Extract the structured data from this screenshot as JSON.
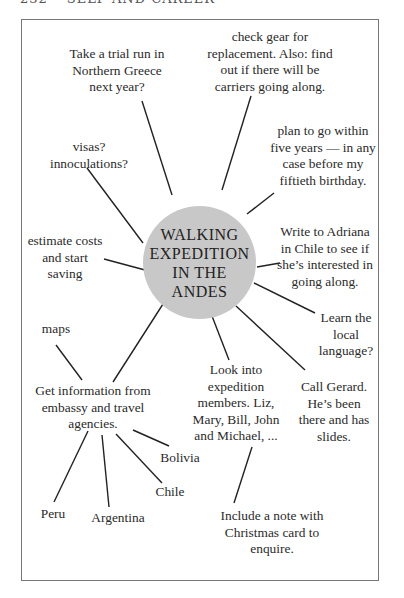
{
  "header": {
    "partial_text": "232 • SELF AND CAREER"
  },
  "colors": {
    "hub_fill": "#c8c8c8",
    "line": "#222222",
    "frame": "#777777"
  },
  "mindmap": {
    "center": "WALKING\nEXPEDITION\nIN THE\nANDES",
    "nodes": {
      "trial_run": "Take a trial run in\nNorthern Greece\nnext year?",
      "gear": "check gear for\nreplacement. Also: find\nout if there will be\ncarriers going along.",
      "plan": "plan to go within\nfive years — in any\ncase before my\nfiftieth birthday.",
      "visas": "visas?\ninnoculations?",
      "adriana": "Write to Adriana\nin Chile to see if\nshe’s interested in\ngoing along.",
      "costs": "estimate costs\nand start\nsaving",
      "language": "Learn the\nlocal\nlanguage?",
      "maps": "maps",
      "members": "Look into\nexpedition\nmembers. Liz,\nMary, Bill, John\nand Michael, ...",
      "gerard": "Call Gerard.\nHe’s been\nthere and has\nslides.",
      "info": "Get information from\nembassy and travel\nagencies.",
      "bolivia": "Bolivia",
      "chile": "Chile",
      "peru": "Peru",
      "argentina": "Argentina",
      "christmas": "Include a note with\nChristmas card to\nenquire."
    }
  }
}
